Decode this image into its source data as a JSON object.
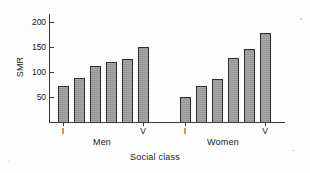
{
  "chart_data": {
    "type": "bar",
    "title": "",
    "xlabel": "Social class",
    "ylabel": "SMR",
    "ylim": [
      0,
      215
    ],
    "yticks": [
      50,
      100,
      150,
      200
    ],
    "ytick_labels": [
      "50",
      "100",
      "150",
      "200"
    ],
    "grid": false,
    "legend": "none",
    "groups": [
      "Men",
      "Women"
    ],
    "categories": [
      "I",
      "II",
      "IIIn",
      "IIIm",
      "IV",
      "V"
    ],
    "category_tick_labels": [
      "I",
      "V"
    ],
    "series": [
      {
        "name": "Men",
        "values": [
          72,
          88,
          112,
          120,
          127,
          151
        ]
      },
      {
        "name": "Women",
        "values": [
          51,
          73,
          87,
          128,
          146,
          178
        ]
      }
    ],
    "bar_fill_color": "#9d9d9d",
    "bar_edge_color": "#2e2e2e",
    "axis_color": "#3a3a3a",
    "background_color": "#fdfdfd"
  },
  "axes": {
    "y_title": "SMR",
    "x_title": "Social class",
    "ticks": [
      {
        "label": "200",
        "value": 200
      },
      {
        "label": "150",
        "value": 150
      },
      {
        "label": "100",
        "value": 100
      },
      {
        "label": "50",
        "value": 50
      }
    ]
  },
  "groups": [
    {
      "label": "Men",
      "first_class_label": "I",
      "last_class_label": "V",
      "bars": [
        {
          "class": "I",
          "value": 72
        },
        {
          "class": "II",
          "value": 88
        },
        {
          "class": "IIIn",
          "value": 112
        },
        {
          "class": "IIIm",
          "value": 120
        },
        {
          "class": "IV",
          "value": 127
        },
        {
          "class": "V",
          "value": 151
        }
      ]
    },
    {
      "label": "Women",
      "first_class_label": "I",
      "last_class_label": "V",
      "bars": [
        {
          "class": "I",
          "value": 51
        },
        {
          "class": "II",
          "value": 73
        },
        {
          "class": "IIIn",
          "value": 87
        },
        {
          "class": "IIIm",
          "value": 128
        },
        {
          "class": "IV",
          "value": 146
        },
        {
          "class": "V",
          "value": 178
        }
      ]
    }
  ]
}
